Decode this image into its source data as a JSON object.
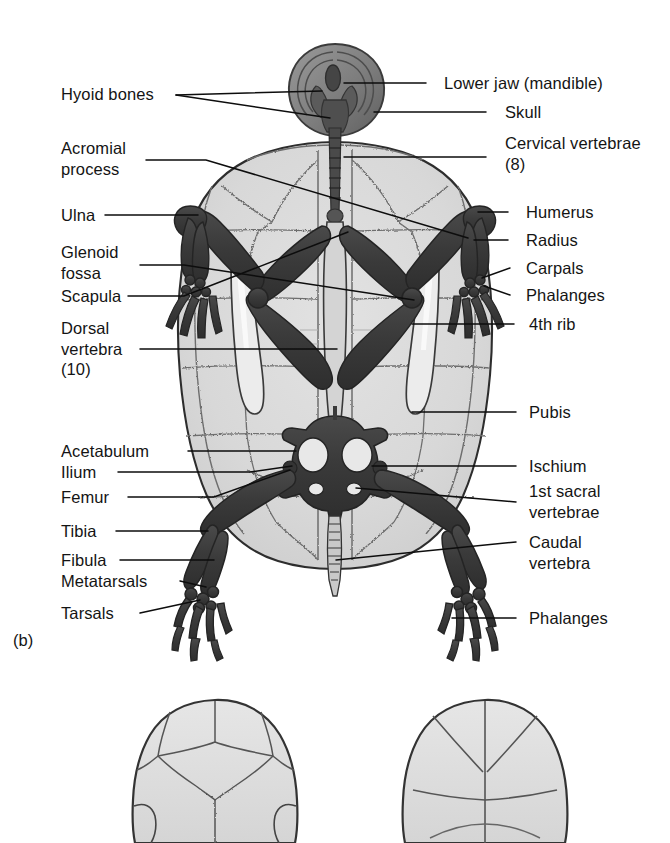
{
  "figure": {
    "panel_tag": "(b)",
    "colors": {
      "background": "#ffffff",
      "shell_fill": "#d9d9d9",
      "shell_fill_light": "#e4e4e4",
      "shell_suture": "#6f6f6f",
      "shell_outline": "#2f2f2f",
      "bone_dark": "#3b3b3b",
      "bone_mid": "#565656",
      "bone_light": "#8f8f8f",
      "leader_line": "#0d0d0d",
      "text": "#141414"
    }
  },
  "labels_left": [
    {
      "id": "hyoid-bones",
      "text": "Hyoid bones"
    },
    {
      "id": "acromial-process",
      "text": "Acromial\nprocess"
    },
    {
      "id": "ulna",
      "text": "Ulna"
    },
    {
      "id": "glenoid-fossa",
      "text": "Glenoid\nfossa"
    },
    {
      "id": "scapula",
      "text": "Scapula"
    },
    {
      "id": "dorsal-vertebra",
      "text": "Dorsal\nvertebra\n(10)"
    },
    {
      "id": "acetabulum",
      "text": "Acetabulum"
    },
    {
      "id": "ilium",
      "text": "Ilium"
    },
    {
      "id": "femur",
      "text": "Femur"
    },
    {
      "id": "tibia",
      "text": "Tibia"
    },
    {
      "id": "fibula",
      "text": "Fibula"
    },
    {
      "id": "metatarsals",
      "text": "Metatarsals"
    },
    {
      "id": "tarsals",
      "text": "Tarsals"
    }
  ],
  "labels_right": [
    {
      "id": "lower-jaw-mandible",
      "text": "Lower jaw (mandible)"
    },
    {
      "id": "skull",
      "text": "Skull"
    },
    {
      "id": "cervical-vertebrae",
      "text": "Cervical vertebrae\n(8)"
    },
    {
      "id": "humerus",
      "text": "Humerus"
    },
    {
      "id": "radius",
      "text": "Radius"
    },
    {
      "id": "carpals",
      "text": "Carpals"
    },
    {
      "id": "phalanges-fore",
      "text": "Phalanges"
    },
    {
      "id": "fourth-rib",
      "text": "4th rib"
    },
    {
      "id": "pubis",
      "text": "Pubis"
    },
    {
      "id": "ischium",
      "text": "Ischium"
    },
    {
      "id": "first-sacral-vertebrae",
      "text": "1st sacral\nvertebrae"
    },
    {
      "id": "caudal-vertebra",
      "text": "Caudal\nvertebra"
    },
    {
      "id": "phalanges-hind",
      "text": "Phalanges"
    }
  ],
  "lower_figures": [
    {
      "id": "shell-outline-left",
      "description": "shell outline with scute sutures"
    },
    {
      "id": "shell-outline-right",
      "description": "shell outline with scute sutures"
    }
  ]
}
